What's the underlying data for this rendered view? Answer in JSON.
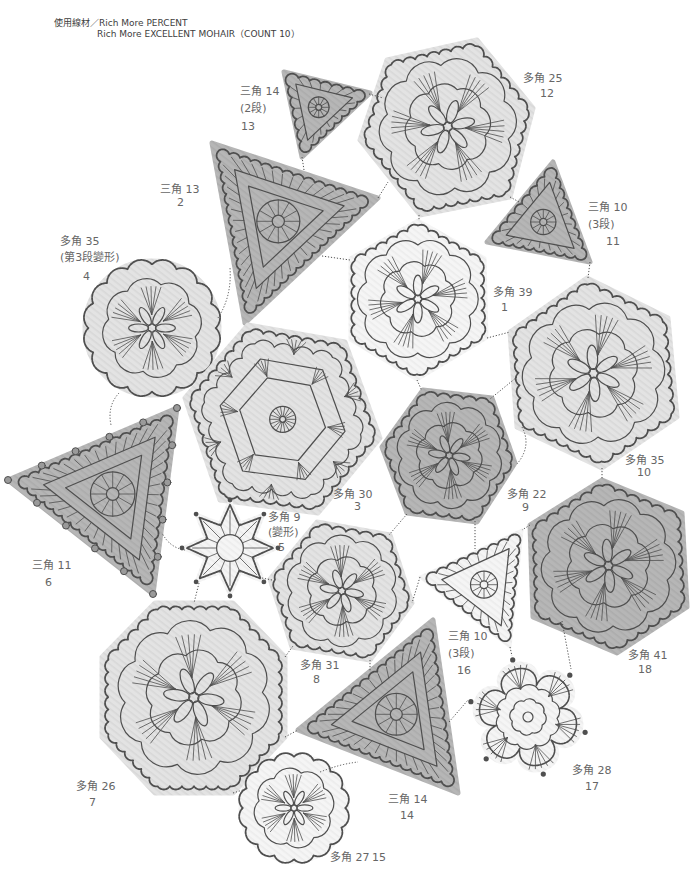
{
  "header": {
    "materials_line1": "使用線材／Rich More PERCENT",
    "materials_line2": "Rich More EXCELLENT MOHAIR（COUNT 10）"
  },
  "palette": {
    "light_fill": "#e3e3e3",
    "light_stripe": "#d8d8d8",
    "dark_fill": "#b6b6b6",
    "dark_stripe": "#acacac",
    "white_fill": "#f5f5f5",
    "white_stripe": "#ececec",
    "stroke": "#4f4f4f",
    "label_text": "#666666",
    "header_text": "#3d3d3d"
  },
  "motifs": [
    {
      "name": "三角 14",
      "note": "(2段)",
      "number": "13",
      "shape": "triangle",
      "tone": "dark"
    },
    {
      "name": "多角 25",
      "number": "12",
      "shape": "hexagon",
      "tone": "light"
    },
    {
      "name": "三角 13",
      "number": "2",
      "shape": "triangle",
      "tone": "dark"
    },
    {
      "name": "三角 10",
      "note": "(3段)",
      "number": "11",
      "shape": "triangle",
      "tone": "dark"
    },
    {
      "name": "多角 35",
      "note": "(第3段變形)",
      "number": "4",
      "shape": "circle",
      "tone": "light"
    },
    {
      "name": "多角 39",
      "number": "1",
      "shape": "hexagon",
      "tone": "white"
    },
    {
      "name": "多角 35",
      "number": "10",
      "shape": "hexagon",
      "tone": "light"
    },
    {
      "name": "多角 30",
      "number": "3",
      "shape": "hexagon",
      "tone": "light"
    },
    {
      "name": "多角 22",
      "number": "9",
      "shape": "hexagon",
      "tone": "dark"
    },
    {
      "name": "三角 11",
      "number": "6",
      "shape": "triangle",
      "tone": "dark"
    },
    {
      "name": "多角 9",
      "note": "(變形)",
      "number": "5",
      "shape": "star",
      "tone": "white"
    },
    {
      "name": "多角 31",
      "number": "8",
      "shape": "hexagon",
      "tone": "light"
    },
    {
      "name": "三角 10",
      "note": "(3段)",
      "number": "16",
      "shape": "triangle",
      "tone": "white"
    },
    {
      "name": "多角 41",
      "number": "18",
      "shape": "hexagon",
      "tone": "dark"
    },
    {
      "name": "多角 26",
      "number": "7",
      "shape": "octagon",
      "tone": "light"
    },
    {
      "name": "三角 14",
      "number": "14",
      "shape": "triangle",
      "tone": "dark"
    },
    {
      "name": "多角 28",
      "number": "17",
      "shape": "flower",
      "tone": "white"
    },
    {
      "name": "多角 27",
      "number": "15",
      "shape": "circle",
      "tone": "white"
    }
  ]
}
